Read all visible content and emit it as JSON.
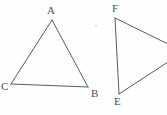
{
  "figure": {
    "canvas": {
      "width": 167,
      "height": 115
    },
    "background_color": "#fefefe",
    "stroke_color": "#5a5a62",
    "label_color": "#4e4e55",
    "stroke_width": 1,
    "shapes": [
      {
        "name": "triangle-abc",
        "kind": "triangle",
        "complete": true,
        "vertices": [
          {
            "label": "A",
            "x": 52,
            "y": 20,
            "label_x": 47,
            "label_y": 5
          },
          {
            "label": "B",
            "x": 88,
            "y": 87,
            "label_x": 91,
            "label_y": 88
          },
          {
            "label": "C",
            "x": 11,
            "y": 84,
            "label_x": 1,
            "label_y": 81
          }
        ],
        "edges": [
          {
            "name": "edge-ca",
            "from": "C",
            "to": "A"
          },
          {
            "name": "edge-ab",
            "from": "A",
            "to": "B"
          },
          {
            "name": "edge-cb",
            "from": "C",
            "to": "B"
          }
        ]
      },
      {
        "name": "triangle-def-partial",
        "kind": "triangle",
        "complete": false,
        "note": "third vertex is cropped off the right edge of the image",
        "vertices": [
          {
            "label": "F",
            "x": 115,
            "y": 18,
            "label_x": 112,
            "label_y": 3
          },
          {
            "label": "E",
            "x": 119,
            "y": 94,
            "label_x": 114,
            "label_y": 96
          }
        ],
        "edges": [
          {
            "name": "edge-fe",
            "from": "F",
            "to": "E"
          },
          {
            "name": "edge-f-right",
            "from": "F",
            "to": "cropped"
          },
          {
            "name": "edge-e-right",
            "from": "E",
            "to": "cropped"
          }
        ],
        "cropped_edge_exits": [
          {
            "name": "exit-top",
            "x": 167,
            "y": 44
          },
          {
            "name": "exit-bottom",
            "x": 167,
            "y": 62
          }
        ]
      }
    ],
    "specks": [
      {
        "name": "speck-upper-middle",
        "x": 95,
        "y": 25,
        "size": 1.5
      }
    ]
  }
}
